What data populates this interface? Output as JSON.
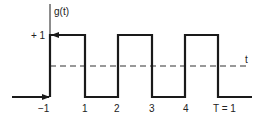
{
  "diagram": {
    "y_axis_label": "g(t)",
    "x_axis_label": "t",
    "level_label": "+ 1",
    "tick_labels": [
      "−1",
      "1",
      "2",
      "3",
      "4",
      "T = 1"
    ],
    "colors": {
      "line": "#1a1a1a",
      "dashed": "#333333",
      "background": "#ffffff"
    },
    "signal": {
      "type": "square-wave",
      "high": 1,
      "transitions_at": [
        "-1",
        "1",
        "2",
        "3",
        "4",
        "T = 1"
      ]
    }
  }
}
